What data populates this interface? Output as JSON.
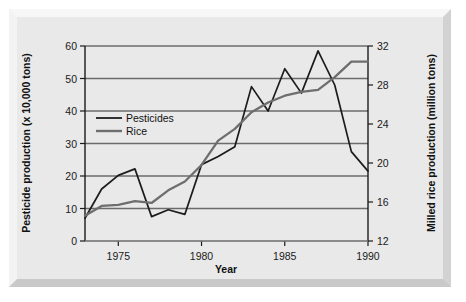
{
  "chart_data": {
    "type": "line",
    "title": "",
    "xlabel": "Year",
    "ylabel": "Pesticide production (x 10,000 tons)",
    "y2label": "Milled rice production (million tons)",
    "grid": true,
    "legend_position": "upper-left-inside",
    "xlim": [
      1973,
      1990
    ],
    "ylim": [
      0,
      60
    ],
    "y2lim": [
      12,
      32
    ],
    "xticks": [
      1975,
      1980,
      1985,
      1990
    ],
    "xtick_labels": [
      "1975",
      "1980",
      "1985",
      "1990"
    ],
    "yticks": [
      0,
      10,
      20,
      30,
      40,
      50,
      60
    ],
    "ytick_labels": [
      "0",
      "10",
      "20",
      "30",
      "40",
      "50",
      "60"
    ],
    "y2ticks": [
      12,
      16,
      20,
      24,
      28,
      32
    ],
    "y2tick_labels": [
      "12",
      "16",
      "20",
      "24",
      "28",
      "32"
    ],
    "x": [
      1973,
      1974,
      1975,
      1976,
      1977,
      1978,
      1979,
      1980,
      1981,
      1982,
      1983,
      1984,
      1985,
      1986,
      1987,
      1988,
      1989,
      1990
    ],
    "series": [
      {
        "name": "Pesticides",
        "axis": "left",
        "color": "#1c1c1c",
        "units": "x 10,000 tons",
        "values": [
          7.0,
          16.0,
          20.2,
          22.2,
          7.5,
          9.6,
          8.2,
          23.5,
          26.0,
          29.0,
          47.5,
          40.0,
          53.0,
          45.5,
          58.5,
          48.0,
          27.5,
          21.5
        ]
      },
      {
        "name": "Rice",
        "axis": "right",
        "color": "#6e6e6e",
        "units": "million tons",
        "values": [
          14.6,
          15.6,
          15.7,
          16.1,
          15.9,
          17.2,
          18.1,
          19.8,
          22.3,
          23.5,
          25.2,
          26.2,
          26.9,
          27.3,
          27.5,
          28.8,
          30.4,
          30.4
        ]
      }
    ],
    "legend": [
      {
        "label": "Pesticides",
        "color": "#1c1c1c"
      },
      {
        "label": "Rice",
        "color": "#6e6e6e"
      }
    ],
    "colors": {
      "pesticides": "#1c1c1c",
      "rice": "#6e6e6e",
      "grid": "#6b6b6b",
      "axis": "#1a1a1a",
      "panel_background": "#e9e9e9",
      "figure_background": "#ffffff"
    }
  }
}
